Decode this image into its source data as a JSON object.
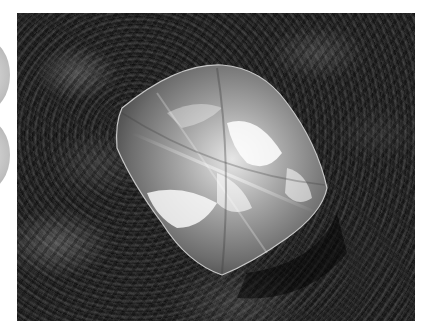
{
  "image": {
    "subject": "rough diamond crystal resting on dark rock",
    "photo_bounds": {
      "left": 17,
      "top": 13,
      "width": 398,
      "height": 308
    },
    "colors": {
      "background": "#ffffff",
      "rock": "#1c1c1c",
      "diamond_highlight": "#f2f2f2",
      "diamond_body": "#8a8a8a"
    }
  }
}
